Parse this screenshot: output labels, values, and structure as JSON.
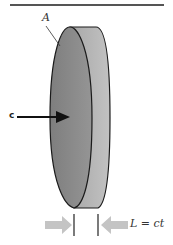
{
  "diagram": {
    "labels": {
      "area": "A",
      "velocity": "c",
      "length": "L = ct"
    },
    "colors": {
      "face": "#8a8a8a",
      "rim": "#b3b3b3",
      "outline": "#1a1a1a",
      "arrow_gray": "#c4c4c4",
      "arrow_black": "#111111",
      "rule": "#555555"
    }
  }
}
